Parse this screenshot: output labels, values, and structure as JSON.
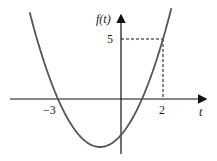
{
  "chart_data": {
    "type": "line",
    "title": "",
    "function": "f(t) = t^2 + 2t - 3",
    "xlabel": "t",
    "ylabel": "f(t)",
    "x_ticks": [
      "-3",
      "2"
    ],
    "y_ticks": [
      "5"
    ],
    "annotations": [
      {
        "point": [
          2,
          5
        ],
        "style": "dashed guides"
      }
    ],
    "roots": [
      -3,
      1
    ],
    "vertex": [
      -1,
      -4
    ],
    "xlim": [
      -5.5,
      4.3
    ],
    "ylim": [
      -4.5,
      7.2
    ],
    "grid": false
  },
  "labels": {
    "y_axis": "f(t)",
    "x_axis": "t",
    "tick_neg3": "−3",
    "tick_2": "2",
    "tick_5": "5"
  },
  "colors": {
    "curve": "#555555",
    "axes": "#111111"
  }
}
